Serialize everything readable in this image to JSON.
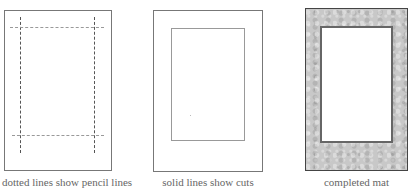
{
  "panels": [
    {
      "id": "pencil-lines",
      "caption": "dotted lines show pencil lines"
    },
    {
      "id": "cuts",
      "caption": "solid lines show cuts"
    },
    {
      "id": "completed",
      "caption": "completed  mat"
    }
  ],
  "colors": {
    "outline": "#777777",
    "mat_fill": "#c8c8c8",
    "caption_text": "#666666"
  }
}
